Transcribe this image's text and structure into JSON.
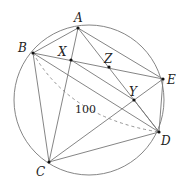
{
  "diagram": {
    "type": "geometry",
    "circle": {
      "cx": 89,
      "cy": 100,
      "r": 75
    },
    "points": [
      {
        "name": "A",
        "x": 78,
        "y": 28,
        "lx": 74,
        "ly": 22
      },
      {
        "name": "B",
        "x": 33,
        "y": 53,
        "lx": 18,
        "ly": 52
      },
      {
        "name": "X",
        "x": 71,
        "y": 60,
        "lx": 58,
        "ly": 56
      },
      {
        "name": "Z",
        "x": 109,
        "y": 67,
        "lx": 104,
        "ly": 63
      },
      {
        "name": "E",
        "x": 163,
        "y": 79,
        "lx": 167,
        "ly": 84
      },
      {
        "name": "Y",
        "x": 134,
        "y": 100,
        "lx": 129,
        "ly": 96
      },
      {
        "name": "D",
        "x": 159,
        "y": 132,
        "lx": 161,
        "ly": 145
      },
      {
        "name": "C",
        "x": 49,
        "y": 162,
        "lx": 36,
        "ly": 176
      }
    ],
    "segments": [
      [
        "A",
        "B"
      ],
      [
        "A",
        "E"
      ],
      [
        "A",
        "C"
      ],
      [
        "A",
        "D"
      ],
      [
        "B",
        "E"
      ],
      [
        "B",
        "C"
      ],
      [
        "B",
        "D"
      ],
      [
        "X",
        "Y"
      ],
      [
        "Y",
        "D"
      ],
      [
        "C",
        "E"
      ],
      [
        "C",
        "D"
      ],
      [
        "E",
        "D"
      ]
    ],
    "dashed_label": "100"
  }
}
